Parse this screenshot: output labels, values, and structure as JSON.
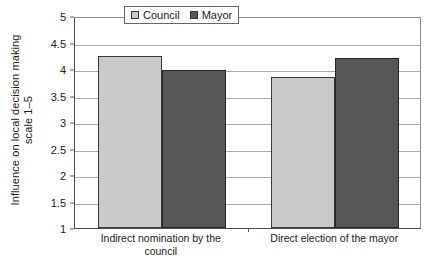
{
  "chart_data": {
    "type": "bar",
    "title": "",
    "subtitle": "",
    "xlabel": "",
    "ylabel": "Influence on local decision making scale 1–5",
    "ylabel_line1": "Influence on local decision making",
    "ylabel_line2": "scale 1–5",
    "categories": [
      "Indirect nomination by the council",
      "Direct election of the mayor"
    ],
    "category_lines": [
      [
        "Indirect nomination by the",
        "council"
      ],
      [
        "Direct election of the mayor"
      ]
    ],
    "series": [
      {
        "name": "Council",
        "color": "#c9c9c9",
        "values": [
          4.25,
          3.85
        ]
      },
      {
        "name": "Mayor",
        "color": "#575757",
        "values": [
          3.99,
          4.21
        ]
      }
    ],
    "ylim": [
      1,
      5
    ],
    "ytick_values": [
      5,
      4.5,
      4,
      3.5,
      3,
      2.5,
      2,
      1.5,
      1
    ],
    "ytick_labels": [
      "5",
      "4.5",
      "4",
      "3.5",
      "3",
      "2.5",
      "2",
      "1.5",
      "1"
    ],
    "grid": true,
    "grid_axis": "y",
    "legend_position": "top-center",
    "legend_entries": [
      "Council",
      "Mayor"
    ]
  }
}
